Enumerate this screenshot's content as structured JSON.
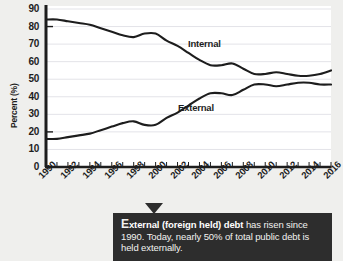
{
  "chart_data": {
    "type": "line",
    "title": "",
    "xlabel": "",
    "ylabel": "Percent (%)",
    "ylim": [
      0,
      90
    ],
    "xlim": [
      1990,
      2016
    ],
    "ytick_labels": [
      "90",
      "80",
      "70",
      "60",
      "50",
      "40",
      "30",
      "20",
      "10",
      "0"
    ],
    "ytick_values": [
      90,
      80,
      70,
      60,
      50,
      40,
      30,
      20,
      10,
      0
    ],
    "xtick_labels": [
      "1990",
      "1992",
      "1994",
      "1996",
      "1998",
      "2000",
      "2002",
      "2004",
      "2006",
      "2008",
      "2010",
      "2012",
      "2014",
      "2016"
    ],
    "xtick_values": [
      1990,
      1992,
      1994,
      1996,
      1998,
      2000,
      2002,
      2004,
      2006,
      2008,
      2010,
      2012,
      2014,
      2016
    ],
    "minor_xticks_every": 1,
    "grid": "horizontal",
    "legend_position": "inline-labels",
    "x": [
      1990,
      1991,
      1992,
      1993,
      1994,
      1995,
      1996,
      1997,
      1998,
      1999,
      2000,
      2001,
      2002,
      2003,
      2004,
      2005,
      2006,
      2007,
      2008,
      2009,
      2010,
      2011,
      2012,
      2013,
      2014,
      2015,
      2016
    ],
    "series": [
      {
        "name": "Internal",
        "label": "Internal",
        "color": "#1d1d1d",
        "values": [
          84,
          84,
          83,
          82,
          81,
          79,
          77,
          75,
          74,
          76,
          76,
          72,
          69,
          65,
          61,
          58,
          58,
          59,
          56,
          53,
          53,
          54,
          53,
          52,
          52,
          53,
          55
        ]
      },
      {
        "name": "External",
        "label": "External",
        "color": "#1d1d1d",
        "values": [
          16,
          16,
          17,
          18,
          19,
          21,
          23,
          25,
          26,
          24,
          24,
          28,
          31,
          35,
          39,
          42,
          42,
          41,
          44,
          47,
          47,
          46,
          47,
          48,
          48,
          47,
          47
        ]
      }
    ]
  },
  "callout": {
    "lead_letter": "E",
    "bold_text": "xternal (foreign held) debt",
    "rest_text": " has risen since 1990. Today, nearly 50% of total public debt is held externally.",
    "background_color": "#2d2d2d",
    "text_color": "#f2f2f0"
  },
  "colors": {
    "page_background": "#efefed",
    "plot_background": "#ffffff",
    "axis": "#1d1d1d",
    "gridline": "#e3e3e8",
    "line": "#1d1d1d"
  }
}
